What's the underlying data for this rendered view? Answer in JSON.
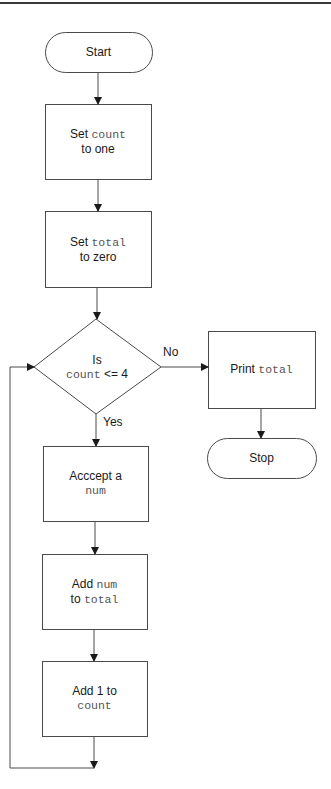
{
  "diagram": {
    "type": "flowchart",
    "nodes": [
      {
        "id": "start",
        "shape": "terminator",
        "parts": [
          [
            {
              "t": "Start",
              "mono": false
            }
          ]
        ]
      },
      {
        "id": "set_count",
        "shape": "process",
        "parts": [
          [
            {
              "t": "Set ",
              "mono": false
            },
            {
              "t": "count",
              "mono": true
            }
          ],
          [
            {
              "t": "to one",
              "mono": false
            }
          ]
        ]
      },
      {
        "id": "set_total",
        "shape": "process",
        "parts": [
          [
            {
              "t": "Set ",
              "mono": false
            },
            {
              "t": "total",
              "mono": true
            }
          ],
          [
            {
              "t": "to zero",
              "mono": false
            }
          ]
        ]
      },
      {
        "id": "decision",
        "shape": "decision",
        "parts": [
          [
            {
              "t": "Is",
              "mono": false
            }
          ],
          [
            {
              "t": "count",
              "mono": true
            },
            {
              "t": " <= 4",
              "mono": false
            }
          ]
        ]
      },
      {
        "id": "print_total",
        "shape": "process",
        "parts": [
          [
            {
              "t": "Print ",
              "mono": false
            },
            {
              "t": "total",
              "mono": true
            }
          ]
        ]
      },
      {
        "id": "stop",
        "shape": "terminator",
        "parts": [
          [
            {
              "t": "Stop",
              "mono": false
            }
          ]
        ]
      },
      {
        "id": "accept_num",
        "shape": "process",
        "parts": [
          [
            {
              "t": "Acccept a",
              "mono": false
            }
          ],
          [
            {
              "t": "num",
              "mono": true
            }
          ]
        ]
      },
      {
        "id": "add_num",
        "shape": "process",
        "parts": [
          [
            {
              "t": "Add ",
              "mono": false
            },
            {
              "t": "num",
              "mono": true
            }
          ],
          [
            {
              "t": "to ",
              "mono": false
            },
            {
              "t": "total",
              "mono": true
            }
          ]
        ]
      },
      {
        "id": "add_one",
        "shape": "process",
        "parts": [
          [
            {
              "t": "Add 1 to",
              "mono": false
            }
          ],
          [
            {
              "t": "count",
              "mono": true
            }
          ]
        ]
      }
    ],
    "edges": [
      {
        "from": "start",
        "to": "set_count",
        "label": ""
      },
      {
        "from": "set_count",
        "to": "set_total",
        "label": ""
      },
      {
        "from": "set_total",
        "to": "decision",
        "label": ""
      },
      {
        "from": "decision",
        "to": "print_total",
        "label": "No"
      },
      {
        "from": "print_total",
        "to": "stop",
        "label": ""
      },
      {
        "from": "decision",
        "to": "accept_num",
        "label": "Yes"
      },
      {
        "from": "accept_num",
        "to": "add_num",
        "label": ""
      },
      {
        "from": "add_num",
        "to": "add_one",
        "label": ""
      },
      {
        "from": "add_one",
        "to": "decision",
        "label": "",
        "loop": true
      }
    ],
    "edge_labels": {
      "no": "No",
      "yes": "Yes"
    }
  }
}
